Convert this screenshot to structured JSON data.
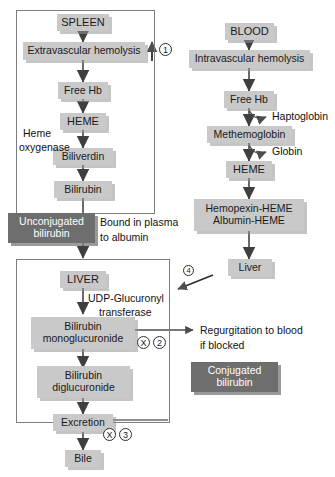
{
  "diagram": {
    "colors": {
      "chip_bg": "#c9c9c9",
      "dark_bg": "#6e6e6e",
      "outline": "#7d7d7d",
      "arrow": "#4d4d4d",
      "text": "#111111"
    }
  },
  "spleen_panel": {
    "nodes": [
      {
        "id": "spleen",
        "label": "SPLEEN"
      },
      {
        "id": "extravascular-hemolysis",
        "label": "Extravascular hemolysis"
      },
      {
        "id": "free-hb-left",
        "label": "Free Hb"
      },
      {
        "id": "heme-left",
        "label": "HEME"
      },
      {
        "id": "biliverdin",
        "label": "Biliverdin"
      },
      {
        "id": "bilirubin",
        "label": "Bilirubin"
      }
    ],
    "enzyme_label_line1": "Heme",
    "enzyme_label_line2": "oxygenase"
  },
  "blood_panel": {
    "nodes": [
      {
        "id": "blood",
        "label": "BLOOD"
      },
      {
        "id": "intravascular-hemolysis",
        "label": "Intravascular hemolysis"
      },
      {
        "id": "free-hb-right",
        "label": "Free Hb"
      },
      {
        "id": "methemoglobin",
        "label": "Methemoglobin"
      },
      {
        "id": "heme-right",
        "label": "HEME"
      },
      {
        "id": "hemopexin-heme",
        "label": "Hemopexin-HEME"
      },
      {
        "id": "albumin-heme",
        "label": "Albumin-HEME"
      },
      {
        "id": "liver-right",
        "label": "Liver"
      }
    ],
    "branch_labels": [
      {
        "id": "haptoglobin",
        "label": "Haptoglobin"
      },
      {
        "id": "globin",
        "label": "Globin"
      }
    ]
  },
  "liver_panel": {
    "nodes": [
      {
        "id": "liver",
        "label": "LIVER"
      },
      {
        "id": "bilirubin-monoglucuronide-l1",
        "label": "Bilirubin"
      },
      {
        "id": "bilirubin-monoglucuronide-l2",
        "label": "monoglucuronide"
      },
      {
        "id": "bilirubin-diglucuronide-l1",
        "label": "Bilirubin"
      },
      {
        "id": "bilirubin-diglucuronide-l2",
        "label": "diglucuronide"
      },
      {
        "id": "excretion",
        "label": "Excretion"
      },
      {
        "id": "bile",
        "label": "Bile"
      }
    ],
    "enzyme_label_line1": "UDP-Glucuronyl",
    "enzyme_label_line2": "transferase"
  },
  "dark_boxes": [
    {
      "id": "unconjugated-bilirubin",
      "line1": "Unconjugated",
      "line2": "bilirubin"
    },
    {
      "id": "conjugated-bilirubin",
      "line1": "Conjugated",
      "line2": "bilirubin"
    }
  ],
  "annotations": {
    "bound_in_plasma_l1": "Bound in plasma",
    "bound_in_plasma_l2": "to albumin",
    "regurgitation_l1": "Regurgitation to blood",
    "regurgitation_l2": "if blocked"
  },
  "markers": {
    "step1": "1",
    "step2": "2",
    "step3": "3",
    "step4": "4",
    "block_symbol": "X"
  }
}
